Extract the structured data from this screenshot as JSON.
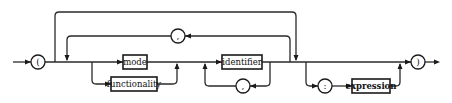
{
  "diagram": {
    "type": "syntax-diagram",
    "nonterminals": {
      "mode": "mode",
      "functionality": "functionality",
      "identifier": "identifier",
      "expression": "expression"
    },
    "terminals": {
      "open_paren": "(",
      "close_paren": ")",
      "comma_outer": ",",
      "comma_inner": ",",
      "colon": ":"
    },
    "colors": {
      "line": "#2a2a2a",
      "background": "#ffffff"
    }
  }
}
